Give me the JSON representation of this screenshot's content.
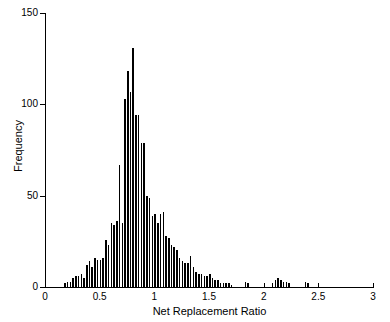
{
  "chart_data": {
    "type": "bar",
    "title": "",
    "subtitle": "",
    "xlabel": "Net Replacement Ratio",
    "ylabel": "Frequency",
    "xlim": [
      0,
      3
    ],
    "ylim": [
      0,
      150
    ],
    "xticks": [
      "0",
      "0.5",
      "1",
      "1.5",
      "2",
      "2.5",
      "3"
    ],
    "xtick_values": [
      0,
      0.5,
      1,
      1.5,
      2,
      2.5,
      3
    ],
    "yticks": [
      "0",
      "50",
      "100",
      "150"
    ],
    "ytick_values": [
      0,
      50,
      100,
      150
    ],
    "grid": false,
    "legend": "none",
    "bin_width": 0.025,
    "bar_color": "#000000",
    "categories": [
      0.1875,
      0.2125,
      0.2375,
      0.2625,
      0.2875,
      0.3125,
      0.3375,
      0.3625,
      0.3875,
      0.4125,
      0.4375,
      0.4625,
      0.4875,
      0.5125,
      0.5375,
      0.5625,
      0.5875,
      0.6125,
      0.6375,
      0.6625,
      0.6875,
      0.7125,
      0.7375,
      0.7625,
      0.7875,
      0.8125,
      0.8375,
      0.8625,
      0.8875,
      0.9125,
      0.9375,
      0.9625,
      0.9875,
      1.0125,
      1.0375,
      1.0625,
      1.0875,
      1.1125,
      1.1375,
      1.1625,
      1.1875,
      1.2125,
      1.2375,
      1.2625,
      1.2875,
      1.3125,
      1.3375,
      1.3625,
      1.3875,
      1.4125,
      1.4375,
      1.4625,
      1.4875,
      1.5125,
      1.5375,
      1.5625,
      1.5875,
      1.6125,
      1.6375,
      1.6625,
      1.6875,
      1.7125,
      1.8375,
      1.8625,
      2.0875,
      2.1125,
      2.1375,
      2.1625,
      2.1875,
      2.2125,
      2.2375,
      2.3875,
      2.4125
    ],
    "values": [
      2,
      3,
      3,
      5,
      6,
      6,
      7,
      5,
      12,
      14,
      11,
      16,
      15,
      15,
      16,
      26,
      23,
      35,
      34,
      36,
      67,
      35,
      103,
      118,
      107,
      131,
      94,
      94,
      79,
      79,
      50,
      49,
      39,
      40,
      35,
      40,
      41,
      28,
      27,
      23,
      22,
      20,
      16,
      14,
      13,
      13,
      17,
      11,
      8,
      7,
      7,
      6,
      6,
      7,
      5,
      4,
      4,
      2,
      2,
      2,
      2,
      1,
      3,
      2,
      2,
      4,
      5,
      4,
      3,
      3,
      2,
      3,
      2
    ]
  },
  "axes": {
    "x_title": "Net Replacement Ratio",
    "y_title": "Frequency"
  }
}
